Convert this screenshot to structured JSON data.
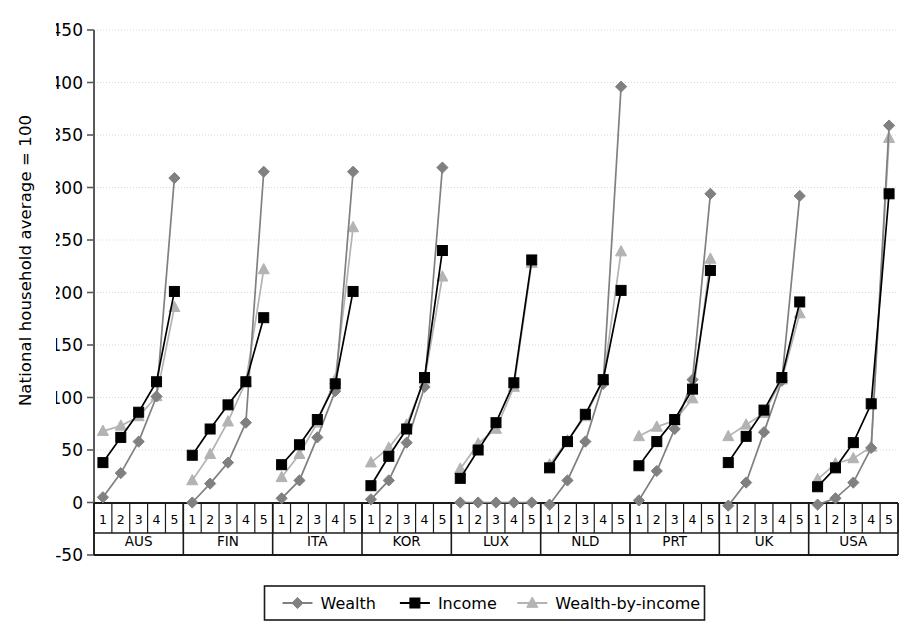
{
  "chart_data": {
    "type": "line",
    "title": "",
    "xlabel": "",
    "ylabel": "National household average = 100",
    "ylim": [
      -50,
      450
    ],
    "ytick_labels": [
      "450",
      "400",
      "350",
      "300",
      "250",
      "200",
      "150",
      "100",
      "50",
      "0",
      "-50"
    ],
    "ytick_values": [
      450,
      400,
      350,
      300,
      250,
      200,
      150,
      100,
      50,
      0,
      -50
    ],
    "grid": true,
    "legend_position": "bottom",
    "group_label": "quintile",
    "quintiles": [
      "1",
      "2",
      "3",
      "4",
      "5"
    ],
    "categories": [
      "AUS",
      "FIN",
      "ITA",
      "KOR",
      "LUX",
      "NLD",
      "PRT",
      "UK",
      "USA"
    ],
    "series": [
      {
        "name": "Wealth",
        "color": "#808080",
        "marker": "diamond",
        "values_by_group": {
          "AUS": [
            5,
            28,
            58,
            101,
            309
          ],
          "FIN": [
            0,
            18,
            38,
            76,
            315
          ],
          "ITA": [
            4,
            21,
            62,
            106,
            315
          ],
          "KOR": [
            3,
            21,
            57,
            110,
            319
          ],
          "LUX": [
            0,
            0,
            0,
            0,
            0
          ],
          "NLD": [
            -2,
            21,
            58,
            113,
            396
          ],
          "PRT": [
            2,
            30,
            70,
            117,
            294
          ],
          "UK": [
            -3,
            19,
            67,
            116,
            292
          ],
          "USA": [
            -2,
            4,
            19,
            52,
            359
          ]
        }
      },
      {
        "name": "Income",
        "color": "#000000",
        "marker": "square",
        "values_by_group": {
          "AUS": [
            38,
            62,
            86,
            115,
            201
          ],
          "FIN": [
            45,
            70,
            93,
            115,
            176
          ],
          "ITA": [
            36,
            55,
            79,
            113,
            201
          ],
          "KOR": [
            16,
            44,
            70,
            119,
            240
          ],
          "LUX": [
            23,
            50,
            76,
            114,
            231
          ],
          "NLD": [
            33,
            58,
            84,
            117,
            202
          ],
          "PRT": [
            35,
            58,
            79,
            108,
            221
          ],
          "UK": [
            38,
            63,
            88,
            119,
            191
          ],
          "USA": [
            15,
            33,
            57,
            94,
            294
          ]
        }
      },
      {
        "name": "Wealth-by-income",
        "color": "#b3b3b3",
        "marker": "triangle",
        "values_by_group": {
          "AUS": [
            68,
            73,
            82,
            101,
            186
          ],
          "FIN": [
            21,
            46,
            77,
            115,
            222
          ],
          "ITA": [
            24,
            46,
            76,
            117,
            262
          ],
          "KOR": [
            38,
            52,
            74,
            117,
            215
          ],
          "LUX": [
            32,
            56,
            70,
            110,
            228
          ],
          "NLD": [
            36,
            59,
            82,
            116,
            239
          ],
          "PRT": [
            63,
            72,
            78,
            99,
            232
          ],
          "UK": [
            63,
            74,
            85,
            117,
            180
          ],
          "USA": [
            22,
            37,
            42,
            53,
            347
          ]
        }
      }
    ]
  },
  "legend": {
    "items": [
      {
        "label": "Wealth"
      },
      {
        "label": "Income"
      },
      {
        "label": "Wealth-by-income"
      }
    ]
  }
}
